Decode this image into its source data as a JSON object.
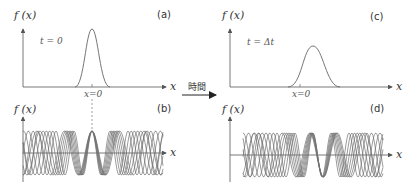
{
  "panels": {
    "a": {
      "tag": "(a)",
      "ylabel": "f (x)",
      "xlabel": "x",
      "time_label": "t = 0",
      "origin_label": "x=0"
    },
    "b": {
      "tag": "(b)",
      "ylabel": "f (x)",
      "xlabel": "x"
    },
    "c": {
      "tag": "(c)",
      "ylabel": "f (x)",
      "xlabel": "x",
      "time_label": "t = Δt",
      "origin_label": "x=0"
    },
    "d": {
      "tag": "(d)",
      "ylabel": "f (x)",
      "xlabel": "x"
    }
  },
  "arrow": {
    "label": "時間"
  },
  "colors": {
    "axis": "#555555",
    "curve": "#666666",
    "wave": "#707070",
    "text": "#333333"
  },
  "waves": {
    "b": {
      "center_x": 92,
      "axis_y": 153,
      "amplitude": 22,
      "x_start": 23,
      "x_end": 163,
      "count": 7
    },
    "d": {
      "center_x": 313,
      "axis_y": 155,
      "amplitude": 22,
      "x_start": 243,
      "x_end": 383,
      "count": 7
    }
  }
}
